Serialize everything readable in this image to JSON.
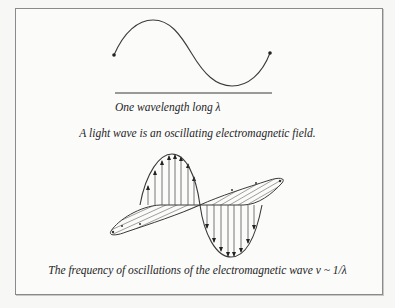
{
  "figure": {
    "top_panel": {
      "caption": "One wavelength long λ",
      "wave": {
        "type": "sine",
        "periods": 1,
        "endpoints": "dot-marked"
      },
      "baseline": "wavelength bar"
    },
    "middle_caption": "A light wave is an oscillating electromagnetic field.",
    "em_wave": {
      "components": [
        "electric field (vertical, arrowed)",
        "magnetic field (horizontal, hatched)"
      ]
    },
    "bottom_caption": "The frequency of oscillations of the electromagnetic wave ν ~ 1/λ"
  },
  "colors": {
    "stroke": "#3a3a3a",
    "border": "#8a8a8a",
    "background": "#fbfbfa"
  }
}
